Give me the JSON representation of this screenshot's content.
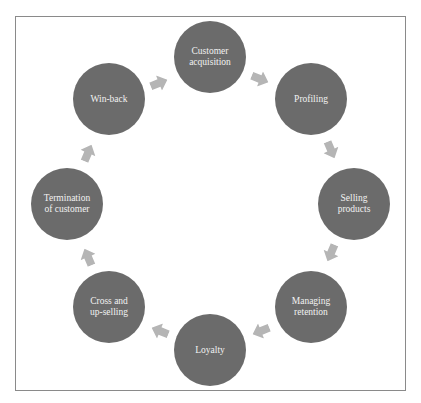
{
  "diagram": {
    "type": "cycle",
    "colors": {
      "node_fill": "#6b6b6b",
      "node_text": "#f2f2f2",
      "arrow_fill": "#b5b5b5",
      "frame_border": "#8a8a8a"
    },
    "nodes": [
      {
        "label": "Customer\nacquisition"
      },
      {
        "label": "Profiling"
      },
      {
        "label": "Selling\nproducts"
      },
      {
        "label": "Managing\nretention"
      },
      {
        "label": "Loyalty"
      },
      {
        "label": "Cross and\nup-selling"
      },
      {
        "label": "Termination\nof customer"
      },
      {
        "label": "Win-back"
      }
    ],
    "edges": [
      {
        "from": "Customer acquisition",
        "to": "Profiling"
      },
      {
        "from": "Profiling",
        "to": "Selling products"
      },
      {
        "from": "Selling products",
        "to": "Managing retention"
      },
      {
        "from": "Managing retention",
        "to": "Loyalty"
      },
      {
        "from": "Loyalty",
        "to": "Cross and up-selling"
      },
      {
        "from": "Cross and up-selling",
        "to": "Termination of customer"
      },
      {
        "from": "Termination of customer",
        "to": "Win-back"
      },
      {
        "from": "Win-back",
        "to": "Customer acquisition"
      }
    ]
  }
}
